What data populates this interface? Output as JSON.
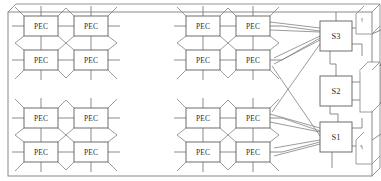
{
  "figure": {
    "type": "architecture-block-diagram",
    "title": "",
    "background_color": "#ffffff",
    "line_color": "#6e6e6e",
    "box_fill": "#ffffff",
    "box_stroke": "#5d5d5d"
  },
  "frame": {
    "name": "chip-outline",
    "style": "3d-extruded-rectangle",
    "x": 8,
    "y": 10,
    "width": 364,
    "height": 164,
    "depth_x": 8,
    "depth_y": -8
  },
  "clusters": [
    {
      "id": "cluster-top-left",
      "origin_x": 14,
      "origin_y": 12,
      "nodes": [
        {
          "id": "tl-n0",
          "label": "PEC",
          "x": 24,
          "y": 16,
          "w": 34,
          "h": 20
        },
        {
          "id": "tl-n1",
          "label": "PEC",
          "x": 74,
          "y": 16,
          "w": 34,
          "h": 20
        },
        {
          "id": "tl-n2",
          "label": "PEC",
          "x": 24,
          "y": 50,
          "w": 34,
          "h": 20
        },
        {
          "id": "tl-n3",
          "label": "PEC",
          "x": 74,
          "y": 50,
          "w": 34,
          "h": 20
        }
      ]
    },
    {
      "id": "cluster-top-right",
      "origin_x": 180,
      "origin_y": 12,
      "nodes": [
        {
          "id": "tr-n0",
          "label": "PEC",
          "x": 186,
          "y": 16,
          "w": 34,
          "h": 20
        },
        {
          "id": "tr-n1",
          "label": "PEC",
          "x": 236,
          "y": 16,
          "w": 34,
          "h": 20
        },
        {
          "id": "tr-n2",
          "label": "PEC",
          "x": 186,
          "y": 50,
          "w": 34,
          "h": 20
        },
        {
          "id": "tr-n3",
          "label": "PEC",
          "x": 236,
          "y": 50,
          "w": 34,
          "h": 20
        }
      ]
    },
    {
      "id": "cluster-bottom-left",
      "origin_x": 14,
      "origin_y": 104,
      "nodes": [
        {
          "id": "bl-n0",
          "label": "PEC",
          "x": 24,
          "y": 108,
          "w": 34,
          "h": 20
        },
        {
          "id": "bl-n1",
          "label": "PEC",
          "x": 74,
          "y": 108,
          "w": 34,
          "h": 20
        },
        {
          "id": "bl-n2",
          "label": "PEC",
          "x": 24,
          "y": 142,
          "w": 34,
          "h": 20
        },
        {
          "id": "bl-n3",
          "label": "PEC",
          "x": 74,
          "y": 142,
          "w": 34,
          "h": 20
        }
      ]
    },
    {
      "id": "cluster-bottom-right",
      "origin_x": 180,
      "origin_y": 104,
      "nodes": [
        {
          "id": "br-n0",
          "label": "PEC",
          "x": 186,
          "y": 108,
          "w": 34,
          "h": 20
        },
        {
          "id": "br-n1",
          "label": "PEC",
          "x": 236,
          "y": 108,
          "w": 34,
          "h": 20
        },
        {
          "id": "br-n2",
          "label": "PEC",
          "x": 186,
          "y": 142,
          "w": 34,
          "h": 20
        },
        {
          "id": "br-n3",
          "label": "PEC",
          "x": 236,
          "y": 142,
          "w": 34,
          "h": 20
        }
      ]
    }
  ],
  "switches": [
    {
      "id": "switch-s3",
      "label": "S3",
      "x": 320,
      "y": 21,
      "w": 32,
      "h": 30
    },
    {
      "id": "switch-s2",
      "label": "S2",
      "x": 320,
      "y": 76,
      "w": 32,
      "h": 30
    },
    {
      "id": "switch-s1",
      "label": "S1",
      "x": 320,
      "y": 122,
      "w": 32,
      "h": 30
    }
  ],
  "node_label": "PEC",
  "switch_labels": [
    "S3",
    "S2",
    "S1"
  ]
}
